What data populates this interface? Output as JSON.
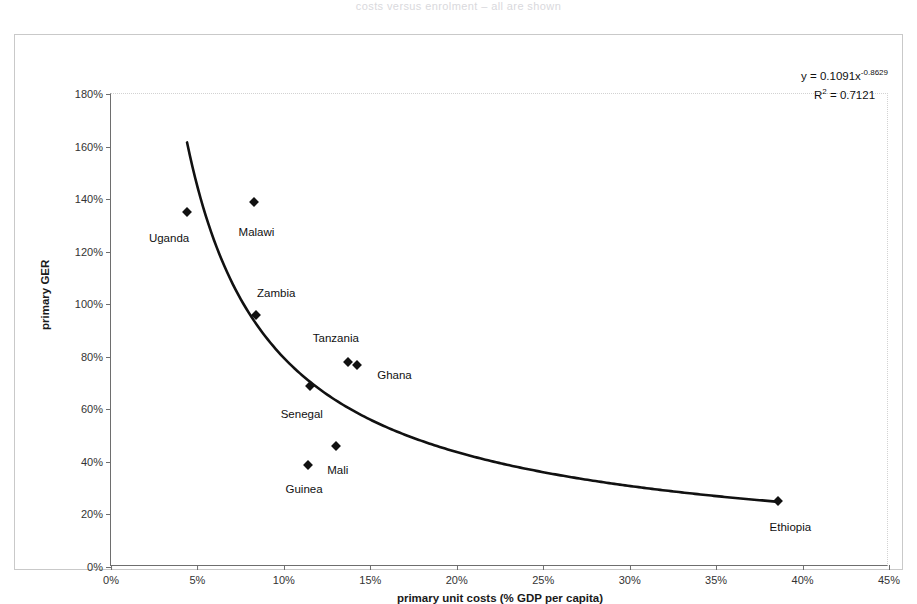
{
  "document": {
    "faint_header": "costs versus enrolment – all are shown"
  },
  "chart_data": {
    "type": "scatter",
    "title": "",
    "xlabel": "primary unit costs (% GDP per capita)",
    "ylabel": "primary GER",
    "xlim": [
      0,
      45
    ],
    "ylim": [
      0,
      180
    ],
    "xticks": [
      "0%",
      "5%",
      "10%",
      "15%",
      "20%",
      "25%",
      "30%",
      "35%",
      "40%",
      "45%"
    ],
    "xtick_values": [
      0,
      5,
      10,
      15,
      20,
      25,
      30,
      35,
      40,
      45
    ],
    "yticks": [
      "0%",
      "20%",
      "40%",
      "60%",
      "80%",
      "100%",
      "120%",
      "140%",
      "160%",
      "180%"
    ],
    "ytick_values": [
      0,
      20,
      40,
      60,
      80,
      100,
      120,
      140,
      160,
      180
    ],
    "grid": false,
    "legend": "none",
    "points": [
      {
        "label": "Uganda",
        "x": 4.4,
        "y": 135,
        "label_dx": -18,
        "label_dy": 26
      },
      {
        "label": "Malawi",
        "x": 8.3,
        "y": 139,
        "label_dx": 2,
        "label_dy": 30
      },
      {
        "label": "Zambia",
        "x": 8.4,
        "y": 96,
        "label_dx": 20,
        "label_dy": -22
      },
      {
        "label": "Tanzania",
        "x": 13.7,
        "y": 78,
        "label_dx": -12,
        "label_dy": -24
      },
      {
        "label": "Ghana",
        "x": 14.2,
        "y": 77,
        "label_dx": 38,
        "label_dy": 10
      },
      {
        "label": "Senegal",
        "x": 11.5,
        "y": 69,
        "label_dx": -8,
        "label_dy": 28
      },
      {
        "label": "Mali",
        "x": 13.0,
        "y": 46,
        "label_dx": 2,
        "label_dy": 24
      },
      {
        "label": "Guinea",
        "x": 11.4,
        "y": 39,
        "label_dx": -4,
        "label_dy": 24
      },
      {
        "label": "Ethiopia",
        "x": 38.6,
        "y": 25,
        "label_dx": 12,
        "label_dy": 26
      }
    ],
    "trendline": {
      "type": "power",
      "coefficient": 0.1091,
      "exponent": -0.8629,
      "r_squared": 0.7121,
      "equation_prefix": "y = 0.1091x",
      "equation_exponent": "-0.8629",
      "r2_prefix": "R",
      "r2_sup": "2",
      "r2_value": " = 0.7121",
      "x_start": 4.4,
      "x_end": 38.6
    }
  }
}
